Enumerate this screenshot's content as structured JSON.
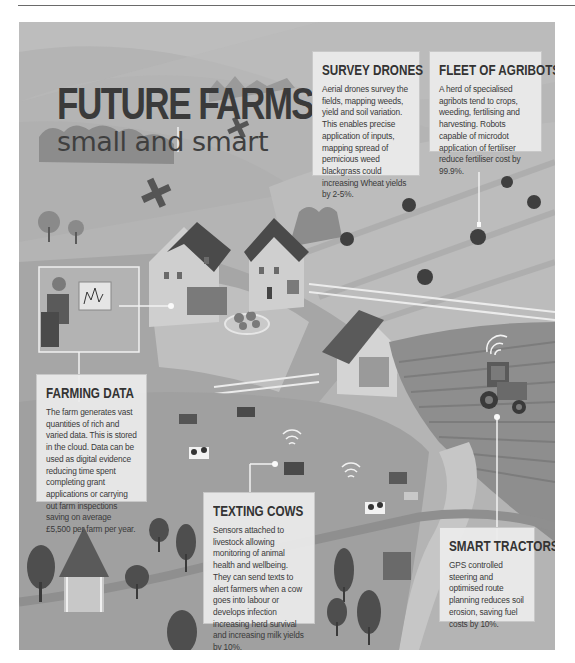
{
  "title": {
    "main": "FUTURE FARMS",
    "sub": "small and smart"
  },
  "cards": {
    "survey_drones": {
      "heading": "SURVEY DRONES",
      "body": "Aerial drones survey the fields, mapping weeds, yield and soil variation. This enables precise application of inputs, mapping spread of pernicious weed blackgrass could  increasing Wheat yields by 2-5%."
    },
    "agribots": {
      "heading": "FLEET OF AGRIBOTS",
      "body": "A herd of specialised agribots tend to crops, weeding, fertilising and harvesting. Robots capable of microdot application of fertiliser reduce fertiliser cost by 99.9%."
    },
    "farming_data": {
      "heading": "FARMING DATA",
      "body": "The farm generates vast quantities of rich and varied data. This is stored in the cloud. Data can be used as digital evidence reducing time spent completing grant applications or carrying out farm inspections saving on average £5,500 per farm per year."
    },
    "texting_cows": {
      "heading": "TEXTING COWS",
      "body": "Sensors attached to livestock allowing monitoring of animal health and wellbeing. They can send texts to alert farmers when a cow goes into labour or develops infection increasing herd survival and increasing milk yields by 10%."
    },
    "smart_tractors": {
      "heading": "SMART TRACTORS",
      "body": "GPS controlled steering and optimised route planning reduces soil erosion, saving fuel costs by 10%."
    }
  },
  "colors": {
    "panel_bg": "#a9a9a9",
    "card_bg": "#ececec",
    "text_dark": "#333333",
    "roof": "#4a4a4a",
    "tree": "#5a5a5a"
  }
}
